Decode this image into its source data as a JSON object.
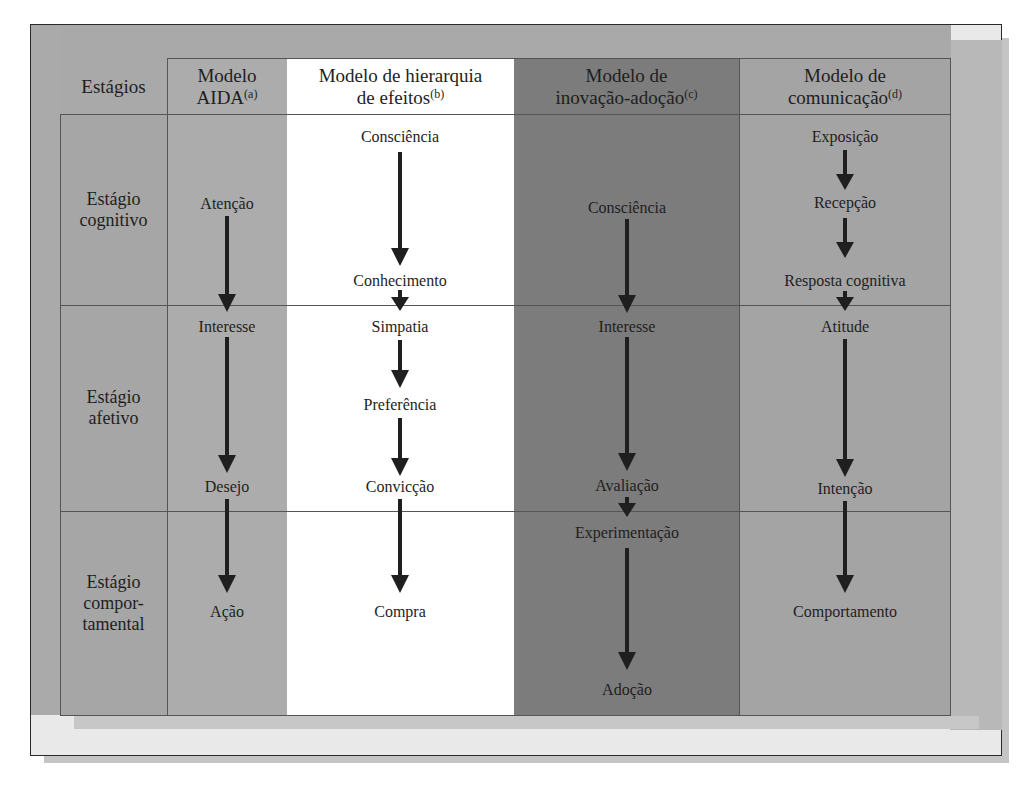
{
  "colors": {
    "frame_bg": "#e9e9e9",
    "frame_band": "#a9a9a9",
    "col_stages": "#a6a6a6",
    "col_aida": "#acacac",
    "col_hierarchy": "#ffffff",
    "col_innovation": "#7c7c7c",
    "col_communication": "#a4a4a4",
    "arrow": "#1f1f1f"
  },
  "header": {
    "stages": "Estágios",
    "aida": {
      "line1": "Modelo",
      "line2": "AIDA",
      "note": "(a)"
    },
    "hierarchy": {
      "line1": "Modelo de hierarquia",
      "line2": "de efeitos",
      "note": "(b)"
    },
    "innovation": {
      "line1": "Modelo de",
      "line2": "inovação-adoção",
      "note": "(c)"
    },
    "communication": {
      "line1": "Modelo de",
      "line2": "comunicação",
      "note": "(d)"
    }
  },
  "stages": [
    {
      "line1": "Estágio",
      "line2": "cognitivo"
    },
    {
      "line1": "Estágio",
      "line2": "afetivo"
    },
    {
      "line1": "Estágio",
      "line2": "compor-",
      "line3": "tamental"
    }
  ],
  "models": {
    "aida": [
      "Atenção",
      "Interesse",
      "Desejo",
      "Ação"
    ],
    "hierarchy": [
      "Consciência",
      "Conhecimento",
      "Simpatia",
      "Preferência",
      "Convicção",
      "Compra"
    ],
    "innovation": [
      "Consciência",
      "Interesse",
      "Avaliação",
      "Experimentação",
      "Adoção"
    ],
    "communication": [
      "Exposição",
      "Recepção",
      "Resposta cognitiva",
      "Atitude",
      "Intenção",
      "Comportamento"
    ]
  }
}
